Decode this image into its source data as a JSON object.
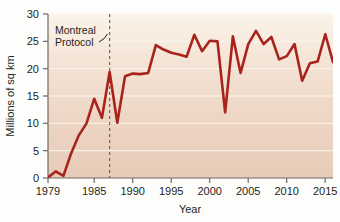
{
  "chart_data": {
    "type": "line",
    "title": "",
    "subtitle": "",
    "xlabel": "Year",
    "ylabel": "Millions of sq km",
    "xlim": [
      1979,
      2016
    ],
    "ylim": [
      0,
      30
    ],
    "grid": true,
    "legend": null,
    "legend_position": "none",
    "line_color": "#A8231B",
    "background_top_color": "#FAF2E6",
    "background_bottom_color": "#E9CDBB",
    "x_ticks": [
      1979,
      1985,
      1990,
      1995,
      2000,
      2005,
      2010,
      2015
    ],
    "x_tick_labels": [
      "1979",
      "1985",
      "1990",
      "1995",
      "2000",
      "2005",
      "2010",
      "2015"
    ],
    "y_ticks": [
      0,
      5,
      10,
      15,
      20,
      25,
      30
    ],
    "y_tick_labels": [
      "0",
      "5",
      "10",
      "15",
      "20",
      "25",
      "30"
    ],
    "x": [
      1979,
      1980,
      1981,
      1982,
      1983,
      1984,
      1985,
      1986,
      1987,
      1988,
      1989,
      1990,
      1991,
      1992,
      1993,
      1994,
      1995,
      1996,
      1997,
      1998,
      1999,
      2000,
      2001,
      2002,
      2003,
      2004,
      2005,
      2006,
      2007,
      2008,
      2009,
      2010,
      2011,
      2012,
      2013,
      2014,
      2015,
      2016
    ],
    "values": [
      0.1,
      1.2,
      0.4,
      4.5,
      7.8,
      10.0,
      14.5,
      11.0,
      19.4,
      10.1,
      18.6,
      19.1,
      19.0,
      19.2,
      24.3,
      23.5,
      22.9,
      22.6,
      22.2,
      26.2,
      23.2,
      25.1,
      25.0,
      12.0,
      25.9,
      19.2,
      24.5,
      26.9,
      24.5,
      25.8,
      21.7,
      22.3,
      24.5,
      17.8,
      21.0,
      21.3,
      26.3,
      21.2
    ],
    "annotations": [
      {
        "label_line1": "Montreal",
        "label_line2": "Protocol",
        "x": 1987,
        "marker": "dashed-vertical-line"
      }
    ]
  }
}
